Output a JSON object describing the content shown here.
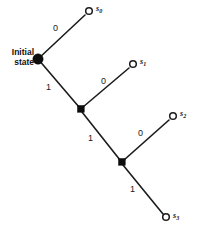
{
  "diagram": {
    "type": "binary-decision-tree",
    "title": "",
    "background_color": "#ffffff",
    "line_color": "#1c1c1c",
    "root": {
      "label_line1": "Initial",
      "label_line2": "state",
      "marker": "filled-circle",
      "x": 38,
      "y": 59
    },
    "branch_nodes": [
      {
        "id": "b1",
        "marker": "filled-square",
        "x": 81,
        "y": 109
      },
      {
        "id": "b2",
        "marker": "filled-square",
        "x": 122,
        "y": 162
      }
    ],
    "leaves": [
      {
        "id": "s0",
        "label": "s",
        "subscript": "0",
        "marker": "open-circle",
        "x": 89,
        "y": 11,
        "label_x": 96,
        "label_y": 5
      },
      {
        "id": "s1",
        "label": "s",
        "subscript": "1",
        "marker": "open-circle",
        "x": 133,
        "y": 64,
        "label_x": 140,
        "label_y": 58
      },
      {
        "id": "s2",
        "label": "s",
        "subscript": "2",
        "marker": "open-circle",
        "x": 173,
        "y": 116,
        "label_x": 180,
        "label_y": 110
      },
      {
        "id": "s3",
        "label": "s",
        "subscript": "3",
        "marker": "open-circle",
        "x": 166,
        "y": 217,
        "label_x": 173,
        "label_y": 212
      }
    ],
    "edges": [
      {
        "id": "e-root-s0",
        "from": "root",
        "to": "s0",
        "label": "0",
        "x1": 38,
        "y1": 59,
        "x2": 85,
        "y2": 15,
        "label_x": 53,
        "label_y": 24
      },
      {
        "id": "e-root-b1",
        "from": "root",
        "to": "b1",
        "label": "1",
        "x1": 38,
        "y1": 59,
        "x2": 79,
        "y2": 107,
        "label_x": 46,
        "label_y": 83
      },
      {
        "id": "e-b1-s1",
        "from": "b1",
        "to": "s1",
        "label": "0",
        "x1": 83,
        "y1": 107,
        "x2": 129,
        "y2": 68,
        "label_x": 101,
        "label_y": 77
      },
      {
        "id": "e-b1-b2",
        "from": "b1",
        "to": "b2",
        "label": "1",
        "x1": 82,
        "y1": 112,
        "x2": 120,
        "y2": 160,
        "label_x": 88,
        "label_y": 134
      },
      {
        "id": "e-b2-s2",
        "from": "b2",
        "to": "s2",
        "label": "0",
        "x1": 124,
        "y1": 160,
        "x2": 169,
        "y2": 120,
        "label_x": 138,
        "label_y": 129
      },
      {
        "id": "e-b2-s3",
        "from": "b2",
        "to": "s3",
        "label": "1",
        "x1": 123,
        "y1": 165,
        "x2": 163,
        "y2": 214,
        "label_x": 130,
        "label_y": 185
      }
    ]
  }
}
